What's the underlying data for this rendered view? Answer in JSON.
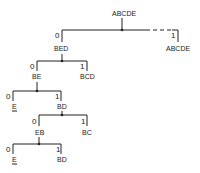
{
  "diagram": {
    "type": "binary-split-tree",
    "root": {
      "label": "ABCDE"
    },
    "levels": [
      {
        "left_bit": "0",
        "left_label": "BED",
        "right_bit": "1",
        "right_label": "ABCDE",
        "right_dashed": true
      },
      {
        "left_bit": "0",
        "left_label": "BE",
        "right_bit": "1",
        "right_label": "BCD"
      },
      {
        "left_bit": "0",
        "left_label": "E",
        "left_underlined": true,
        "right_bit": "1",
        "right_label": "BD"
      },
      {
        "left_bit": "0",
        "left_label": "EB",
        "right_bit": "1",
        "right_label": "BC"
      },
      {
        "left_bit": "0",
        "left_label": "E",
        "left_underlined": true,
        "right_bit": "1",
        "right_label": "BD"
      }
    ],
    "colors": {
      "ink": "#222222",
      "background": "#ffffff"
    }
  }
}
